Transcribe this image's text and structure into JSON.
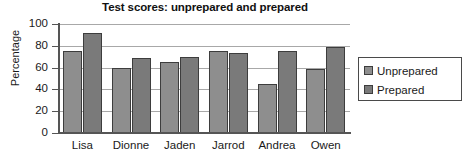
{
  "chart_data": {
    "type": "bar",
    "title": "Test scores: unprepared and prepared",
    "xlabel": "",
    "ylabel": "Percentage",
    "categories": [
      "Lisa",
      "Dionne",
      "Jaden",
      "Jarrod",
      "Andrea",
      "Owen"
    ],
    "series": [
      {
        "name": "Unprepared",
        "color": "#8e8e8e",
        "values": [
          75,
          60,
          65,
          75,
          45,
          59
        ]
      },
      {
        "name": "Prepared",
        "color": "#7a7a7a",
        "values": [
          92,
          69,
          70,
          73,
          75,
          79
        ]
      }
    ],
    "ylim": [
      0,
      100
    ],
    "yticks": [
      0,
      20,
      40,
      60,
      80,
      100
    ],
    "ytick_labels": [
      "0",
      "20",
      "40",
      "60",
      "80",
      "100"
    ],
    "grid": "horizontal",
    "legend_position": "right",
    "legend_entries": [
      "Unprepared",
      "Prepared"
    ]
  },
  "colors": {
    "unprepared": "#8e8e8e",
    "prepared": "#7a7a7a",
    "bar_border": "#3d3d3d",
    "axis": "#555555",
    "gridline": "#a8a8a8",
    "text": "#1a1a1a",
    "background": "#ffffff"
  }
}
